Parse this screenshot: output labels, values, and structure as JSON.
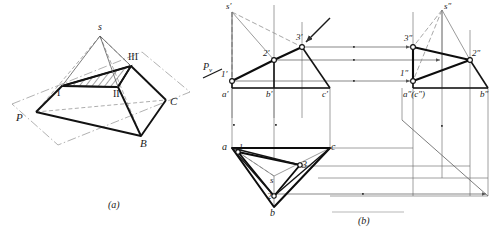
{
  "figure": {
    "captions": {
      "a": "(a)",
      "b": "(b)"
    },
    "colors": {
      "ink": "#1a1a1a",
      "thin": "#555555",
      "construction": "#8c8c8c",
      "hatch": "#2a2a2a",
      "paper": "#ffffff"
    }
  },
  "pictorial": {
    "name": "pictorial-view",
    "caption": "(a)",
    "labels": [
      {
        "id": "apex",
        "text": "s",
        "style": "italic"
      },
      {
        "id": "plane",
        "text": "P",
        "style": "italic"
      },
      {
        "id": "vertex-b",
        "text": "B",
        "style": "italic"
      },
      {
        "id": "vertex-c",
        "text": "C",
        "style": "italic"
      },
      {
        "id": "sect-1",
        "text": "I",
        "style": "roman"
      },
      {
        "id": "sect-2",
        "text": "II",
        "style": "roman"
      },
      {
        "id": "sect-3",
        "text": "III",
        "style": "roman"
      }
    ]
  },
  "orthographic": {
    "name": "orthographic-view",
    "caption": "(b)",
    "plane_trace": {
      "label": "P",
      "subscript": "v"
    },
    "front_view": {
      "name": "front-view",
      "labels": [
        {
          "id": "s-front",
          "text": "s′"
        },
        {
          "id": "p1-front",
          "text": "1′"
        },
        {
          "id": "p2-front",
          "text": "2′"
        },
        {
          "id": "p3-front",
          "text": "3′"
        },
        {
          "id": "a-front",
          "text": "a′"
        },
        {
          "id": "b-front",
          "text": "b′"
        },
        {
          "id": "c-front",
          "text": "c′"
        }
      ]
    },
    "side_view": {
      "name": "side-view",
      "labels": [
        {
          "id": "s-side",
          "text": "s″"
        },
        {
          "id": "p1-side",
          "text": "1″"
        },
        {
          "id": "p2-side",
          "text": "2″"
        },
        {
          "id": "p3-side",
          "text": "3″"
        },
        {
          "id": "ac-side",
          "text": "a″(c″)"
        },
        {
          "id": "b-side",
          "text": "b″"
        }
      ]
    },
    "top_view": {
      "name": "top-view",
      "labels": [
        {
          "id": "a-top",
          "text": "a"
        },
        {
          "id": "b-top",
          "text": "b"
        },
        {
          "id": "c-top",
          "text": "c"
        },
        {
          "id": "s-top",
          "text": "s"
        },
        {
          "id": "p1-top",
          "text": "1"
        },
        {
          "id": "p2-top",
          "text": "2"
        },
        {
          "id": "p3-top",
          "text": "3"
        }
      ]
    }
  }
}
